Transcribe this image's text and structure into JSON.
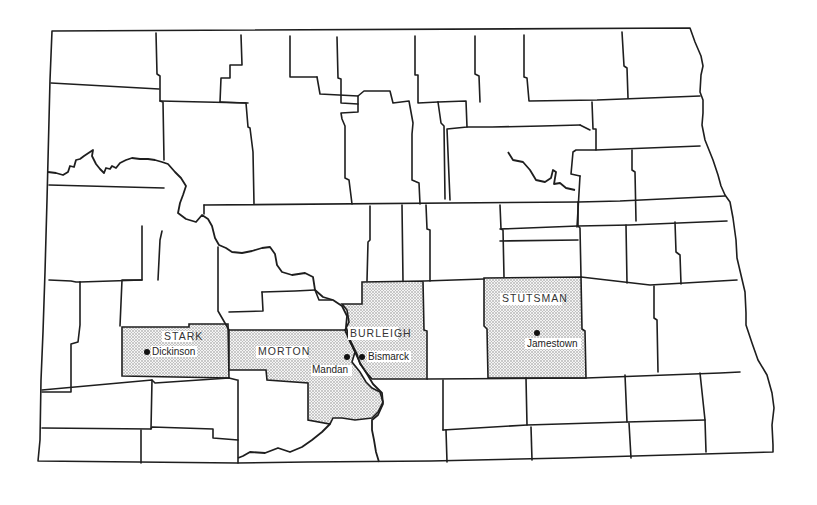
{
  "map": {
    "region": "North Dakota",
    "colors": {
      "line": "#1e1e1e",
      "highlight_pattern": "#8a8a8a",
      "background": "#ffffff"
    },
    "highlighted_counties": [
      {
        "name": "STARK",
        "seat": "Dickinson"
      },
      {
        "name": "MORTON",
        "seat": "Mandan"
      },
      {
        "name": "BURLEIGH",
        "seat": "Bismarck"
      },
      {
        "name": "STUTSMAN",
        "seat": "Jamestown"
      }
    ],
    "labels": {
      "stark": "STARK",
      "dickinson": "Dickinson",
      "morton": "MORTON",
      "mandan": "Mandan",
      "burleigh": "BURLEIGH",
      "bismarck": "Bismarck",
      "stutsman": "STUTSMAN",
      "jamestown": "Jamestown"
    }
  }
}
